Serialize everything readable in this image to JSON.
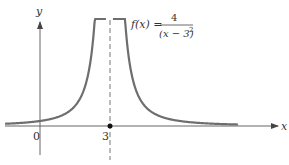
{
  "chart_data": {
    "type": "line",
    "title": "",
    "function_label": "f(x) = 4/(x−3)²",
    "function": {
      "prefix": "f(x) =",
      "numerator": "4",
      "denominator": "(x − 3)",
      "exponent": "2"
    },
    "xlabel": "x",
    "ylabel": "y",
    "x_ticks": [
      {
        "value": 0,
        "label": "0"
      },
      {
        "value": 3,
        "label": "3"
      }
    ],
    "vertical_asymptote": {
      "x": 3,
      "style": "dashed"
    },
    "marked_point": {
      "x": 3,
      "y": 0
    },
    "xlim": [
      -1.5,
      10.4
    ],
    "ylim": [
      -2.6,
      9.4
    ],
    "grid": false,
    "series": [
      {
        "name": "f(x) = 4/(x-3)^2, left branch",
        "x": [
          -1.5,
          -1,
          0,
          1,
          1.5,
          2,
          2.3,
          2.5,
          2.65,
          2.8
        ],
        "y": [
          0.2,
          0.25,
          0.44,
          1.0,
          1.78,
          4.0,
          8.16,
          16,
          32.7,
          100
        ]
      },
      {
        "name": "f(x) = 4/(x-3)^2, right branch",
        "x": [
          3.2,
          3.35,
          3.5,
          3.7,
          4,
          4.5,
          5,
          6,
          7,
          8,
          9
        ],
        "y": [
          100,
          32.7,
          16,
          8.16,
          4.0,
          1.78,
          1.0,
          0.44,
          0.25,
          0.16,
          0.11
        ]
      }
    ],
    "colors": {
      "curve": "#6e6e6e",
      "axes": "#555555",
      "text": "#333333"
    }
  }
}
